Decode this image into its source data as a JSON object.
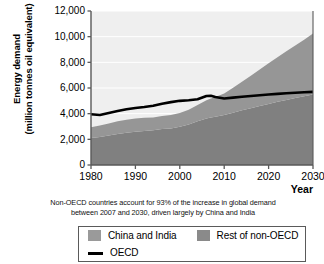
{
  "chart_data": {
    "type": "area",
    "title": "",
    "xlabel": "Year",
    "ylabel_line1": "Energy demand",
    "ylabel_line2": "(million tonnes oil equivalent)",
    "xlim": [
      1980,
      2030
    ],
    "ylim": [
      0,
      12000
    ],
    "grid": true,
    "legend_position": "below-plot",
    "xticks": [
      "1980",
      "1990",
      "2000",
      "2010",
      "2020",
      "2030"
    ],
    "xtick_values": [
      1980,
      1990,
      2000,
      2010,
      2020,
      2030
    ],
    "yticks": [
      "0",
      "2,000",
      "4,000",
      "6,000",
      "8,000",
      "10,000",
      "12,000"
    ],
    "ytick_values": [
      0,
      2000,
      4000,
      6000,
      8000,
      10000,
      12000
    ],
    "x": [
      1980,
      1982,
      1984,
      1986,
      1988,
      1990,
      1992,
      1994,
      1996,
      1998,
      2000,
      2002,
      2004,
      2006,
      2007,
      2008,
      2010,
      2012,
      2014,
      2016,
      2018,
      2020,
      2022,
      2024,
      2026,
      2028,
      2030
    ],
    "series": [
      {
        "name": "China and India",
        "color": "#808080",
        "stack_order": 1,
        "values": [
          2100,
          2180,
          2300,
          2420,
          2520,
          2600,
          2640,
          2700,
          2800,
          2850,
          2980,
          3150,
          3400,
          3620,
          3700,
          3760,
          3900,
          4080,
          4260,
          4430,
          4600,
          4760,
          4920,
          5070,
          5220,
          5360,
          5500
        ]
      },
      {
        "name": "Rest of non-OECD",
        "color": "#969696",
        "stack_order": 2,
        "values": [
          850,
          900,
          940,
          980,
          1000,
          1030,
          1040,
          1000,
          1020,
          1040,
          1080,
          1150,
          1280,
          1420,
          1480,
          1540,
          1680,
          1940,
          2220,
          2520,
          2840,
          3160,
          3480,
          3800,
          4100,
          4400,
          4750
        ]
      }
    ],
    "stack_totals": [
      2950,
      3080,
      3240,
      3400,
      3520,
      3630,
      3680,
      3700,
      3820,
      3890,
      4060,
      4300,
      4680,
      5040,
      5180,
      5300,
      5580,
      6020,
      6480,
      6950,
      7440,
      7920,
      8400,
      8870,
      9320,
      9760,
      10250
    ],
    "line_series": {
      "name": "OECD",
      "color": "#000000",
      "values": [
        3950,
        3900,
        4050,
        4200,
        4340,
        4440,
        4520,
        4620,
        4780,
        4900,
        5000,
        5050,
        5120,
        5380,
        5400,
        5300,
        5180,
        5250,
        5320,
        5380,
        5440,
        5490,
        5540,
        5590,
        5630,
        5670,
        5700
      ]
    },
    "plot_background": "#efefef",
    "gridline_color": "#ffffff",
    "axis_color": "#595959"
  },
  "caption": {
    "line1": "Non-OECD countries account for 93% of the increase in global demand",
    "line2": "between 2007 and 2030, driven largely by China and India"
  },
  "legend": {
    "items": [
      {
        "label": "China and India",
        "swatch_color": "#9a9a9a",
        "marker": "square"
      },
      {
        "label": "Rest of non-OECD",
        "swatch_color": "#8a8a8a",
        "marker": "square"
      },
      {
        "label": "OECD",
        "swatch_color": "#000000",
        "marker": "line"
      }
    ]
  }
}
